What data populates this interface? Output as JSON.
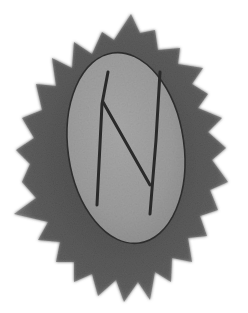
{
  "image": {
    "subject": "rune stone",
    "description": "Grey oval stone carved with an angular rune, set on a dark grey spiky starburst background",
    "rune_glyph": "ᚺ",
    "colors": {
      "background": "#ffffff",
      "starburst": "#5f5f5f",
      "starburst_dark": "#4a4a4a",
      "stone": "#9a9a9a",
      "stone_light": "#b3b3b3",
      "carving": "#2a2a2a"
    }
  }
}
